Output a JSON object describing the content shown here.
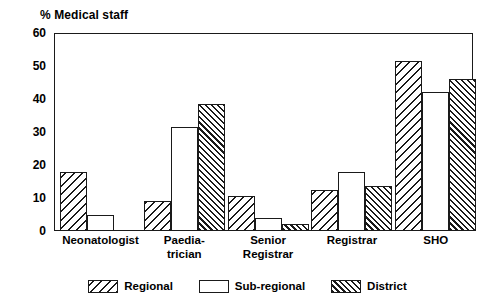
{
  "chart_data": {
    "type": "bar",
    "title": "% Medical staff",
    "xlabel": "",
    "ylabel": "",
    "ylim": [
      0,
      60
    ],
    "yticks": [
      0,
      10,
      20,
      30,
      40,
      50,
      60
    ],
    "grid": false,
    "legend_position": "bottom-center",
    "categories": [
      "Neonatologist",
      "Paedia-\ntrician",
      "Senior\nRegistrar",
      "Registrar",
      "SHO"
    ],
    "series": [
      {
        "name": "Regional",
        "pattern": "diagonal-hatch-back",
        "values": [
          18,
          9,
          10.5,
          12.5,
          51.5
        ]
      },
      {
        "name": "Sub-regional",
        "pattern": "dotted-stipple",
        "values": [
          5,
          31.5,
          4,
          18,
          42
        ]
      },
      {
        "name": "District",
        "pattern": "diagonal-hatch-dense",
        "values": [
          0,
          38.5,
          2,
          13.5,
          46
        ]
      }
    ]
  },
  "axis": {
    "y_tick_labels": [
      "60",
      "50",
      "40",
      "30",
      "20",
      "10",
      "0"
    ]
  },
  "legend": {
    "items": [
      {
        "label": "Regional"
      },
      {
        "label": "Sub-regional"
      },
      {
        "label": "District"
      }
    ]
  }
}
